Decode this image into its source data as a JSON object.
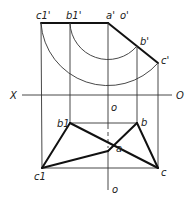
{
  "diagram": {
    "type": "orthographic projection",
    "axis": {
      "left_label": "X",
      "right_label": "O"
    },
    "labels": {
      "c1_prime": "c1'",
      "b1_prime": "b1'",
      "a_prime": "a'",
      "o_prime": "o'",
      "b_prime": "b'",
      "c_prime": "c'",
      "o_upper": "o",
      "b1": "b1",
      "b": "b",
      "a": "a",
      "c1": "c1",
      "c": "c",
      "o_lower": "o"
    },
    "points": {
      "c1_prime": [
        41,
        23
      ],
      "b1_prime": [
        70,
        23
      ],
      "a_prime": [
        108,
        23
      ],
      "b_prime": [
        137,
        46
      ],
      "c_prime": [
        158,
        63
      ],
      "b1": [
        70,
        123
      ],
      "b": [
        137,
        123
      ],
      "a": [
        108,
        151
      ],
      "c1": [
        42,
        168
      ],
      "c": [
        158,
        168
      ]
    }
  }
}
